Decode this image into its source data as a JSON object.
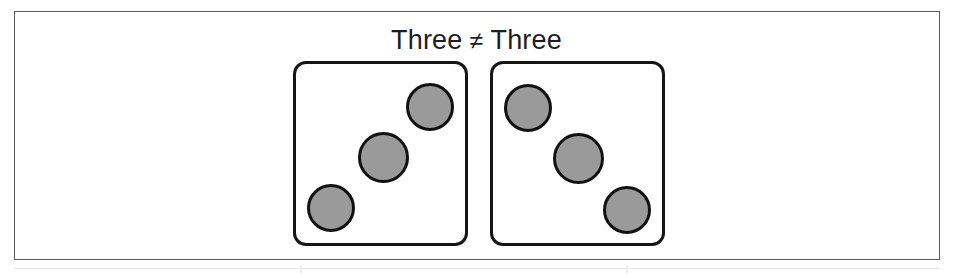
{
  "figure": {
    "caption": {
      "left_word": "Three",
      "operator": "≠",
      "right_word": "Three",
      "full_text": "Three ≠ Three"
    },
    "colors": {
      "pip_fill": "#9a9a9a",
      "pip_stroke": "#111111",
      "panel_stroke": "#151515",
      "frame_border": "#5b5b5b",
      "background": "#ffffff",
      "caption_text": "#1d1d1d"
    },
    "panels": [
      {
        "name": "left-dice-panel",
        "pip_count": 3,
        "arrangement": "ascending-diagonal",
        "pips": [
          {
            "name": "pip-bottom-left",
            "left": 307,
            "top": 184,
            "size": 48
          },
          {
            "name": "pip-center",
            "left": 358,
            "top": 132,
            "size": 51
          },
          {
            "name": "pip-top-right",
            "left": 406,
            "top": 83,
            "size": 48
          }
        ]
      },
      {
        "name": "right-dice-panel",
        "pip_count": 3,
        "arrangement": "descending-diagonal",
        "pips": [
          {
            "name": "pip-top-left",
            "left": 504,
            "top": 84,
            "size": 48
          },
          {
            "name": "pip-center",
            "left": 553,
            "top": 133,
            "size": 51
          },
          {
            "name": "pip-bottom-right",
            "left": 603,
            "top": 186,
            "size": 48
          }
        ]
      }
    ]
  }
}
